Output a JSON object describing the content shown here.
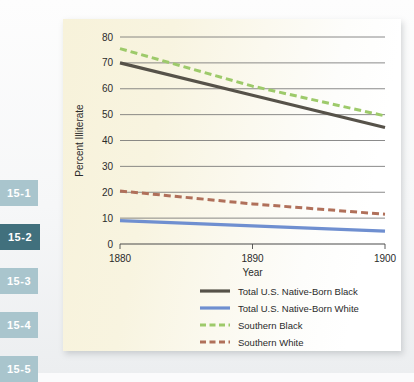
{
  "sidebar": {
    "tabs": [
      {
        "label": "15-1",
        "active": false
      },
      {
        "label": "15-2",
        "active": true
      },
      {
        "label": "15-3",
        "active": false
      },
      {
        "label": "15-4",
        "active": false
      },
      {
        "label": "15-5",
        "active": false
      }
    ],
    "colors": {
      "inactive_bg": "#a9c5cd",
      "active_bg": "#41707d",
      "text": "#ffffff"
    }
  },
  "figure": {
    "background": "#f7f2da",
    "panel_shadow": "rgba(120,125,130,0.30)"
  },
  "chart_data": {
    "type": "line",
    "title": "",
    "xlabel": "Year",
    "ylabel": "Percent Illiterate",
    "x": [
      1880,
      1890,
      1900
    ],
    "xlim": [
      1880,
      1900
    ],
    "ylim": [
      0,
      80
    ],
    "xticks": [
      "1880",
      "1890",
      "1900"
    ],
    "yticks": [
      "0",
      "10",
      "20",
      "30",
      "40",
      "50",
      "60",
      "70",
      "80"
    ],
    "grid": true,
    "grid_axis": "y",
    "legend_position": "below-plot",
    "series": [
      {
        "name": "Total U.S. Native-Born Black",
        "values": [
          70,
          57.5,
          45
        ],
        "color": "#565249",
        "style": "solid",
        "width": 3.2
      },
      {
        "name": "Total U.S. Native-Born White",
        "values": [
          9,
          7,
          5
        ],
        "color": "#6f8fd0",
        "style": "solid",
        "width": 3.2
      },
      {
        "name": "Southern Black",
        "values": [
          75.5,
          61,
          49.5
        ],
        "color": "#9dca6a",
        "style": "dashed",
        "width": 3.0
      },
      {
        "name": "Southern White",
        "values": [
          20.5,
          15.5,
          11.5
        ],
        "color": "#b0705a",
        "style": "dashed",
        "width": 3.0
      }
    ]
  }
}
